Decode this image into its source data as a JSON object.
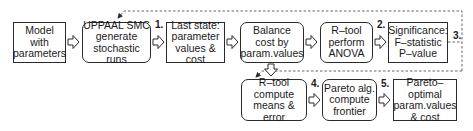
{
  "diagram": {
    "nodes": [
      {
        "id": "model",
        "label": "Model\nwith\nparameters",
        "shape": "rect"
      },
      {
        "id": "uppaal",
        "label": "UPPAAL SMC\ngenerate\nstochastic runs",
        "shape": "rounded"
      },
      {
        "id": "last_state",
        "label": "Last state:\nparameter\nvalues & cost",
        "shape": "rect"
      },
      {
        "id": "balance",
        "label": "Balance\ncost by\nparam.values",
        "shape": "rounded"
      },
      {
        "id": "anova",
        "label": "R–tool\nperform\nANOVA",
        "shape": "rounded"
      },
      {
        "id": "significance",
        "label": "Significance:\nF–statistic\nP–value",
        "shape": "rect"
      },
      {
        "id": "means",
        "label": "R–tool\ncompute\nmeans & error",
        "shape": "rounded"
      },
      {
        "id": "pareto_alg",
        "label": "Pareto alg.\ncompute\nfrontier",
        "shape": "rounded"
      },
      {
        "id": "pareto_opt",
        "label": "Pareto–optimal\nparam.values\n& cost",
        "shape": "rect"
      }
    ],
    "steps": [
      "1.",
      "2.",
      "3.",
      "4.",
      "5."
    ],
    "edges": [
      {
        "from": "model",
        "to": "uppaal",
        "style": "hollow-arrow"
      },
      {
        "from": "uppaal",
        "to": "last_state",
        "style": "hollow-arrow",
        "label": "1."
      },
      {
        "from": "last_state",
        "to": "balance",
        "style": "hollow-arrow"
      },
      {
        "from": "balance",
        "to": "anova",
        "style": "hollow-arrow"
      },
      {
        "from": "anova",
        "to": "significance",
        "style": "hollow-arrow",
        "label": "2."
      },
      {
        "from": "significance",
        "to": "uppaal",
        "style": "dashed-feedback",
        "label": "3."
      },
      {
        "from": "significance",
        "to": "means",
        "style": "dashed-feedback",
        "label": "3."
      },
      {
        "from": "balance",
        "to": "means",
        "style": "hollow-arrow-down"
      },
      {
        "from": "means",
        "to": "pareto_alg",
        "style": "hollow-arrow",
        "label": "4."
      },
      {
        "from": "pareto_alg",
        "to": "pareto_opt",
        "style": "hollow-arrow",
        "label": "5."
      }
    ]
  }
}
